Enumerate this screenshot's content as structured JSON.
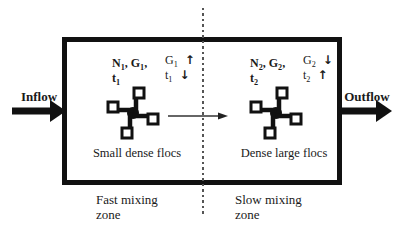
{
  "figure": {
    "inflow_label": "Inflow",
    "outflow_label": "Outflow"
  },
  "zones": {
    "fast": {
      "params_line1": [
        {
          "text": "N",
          "sub": "1"
        },
        {
          "text": ", G",
          "sub": "1"
        },
        {
          "text": ","
        }
      ],
      "params_line2": {
        "text": "t",
        "sub": "1"
      },
      "indicators": [
        {
          "text": "G",
          "sub": "1",
          "arrow": "↑"
        },
        {
          "text": "t",
          "sub": "1",
          "arrow": "↓"
        }
      ],
      "floc_label": "Small dense flocs",
      "zone_label": {
        "line1": "Fast mixing",
        "line2": "zone"
      }
    },
    "slow": {
      "params_line1": [
        {
          "text": "N",
          "sub": "2"
        },
        {
          "text": ", G",
          "sub": "2"
        },
        {
          "text": ","
        }
      ],
      "params_line2": {
        "text": "t",
        "sub": "2"
      },
      "indicators": [
        {
          "text": "G",
          "sub": "2",
          "arrow": "↓"
        },
        {
          "text": "t",
          "sub": "2",
          "arrow": "↑"
        }
      ],
      "floc_label": "Dense large flocs",
      "zone_label": {
        "line1": "Slow mixing",
        "line2": "zone"
      }
    }
  },
  "icons": {
    "impeller": "pinwheel-impeller",
    "inflow_arrow": "thick-right-arrow",
    "outflow_arrow": "thick-right-arrow",
    "flow_direction": "thin-right-arrow",
    "zone_divider": "vertical-dashed-line"
  },
  "colors": {
    "ink": "#111111",
    "text": "#1a1a1a",
    "dashed_line": "#555555",
    "background": "#ffffff"
  }
}
